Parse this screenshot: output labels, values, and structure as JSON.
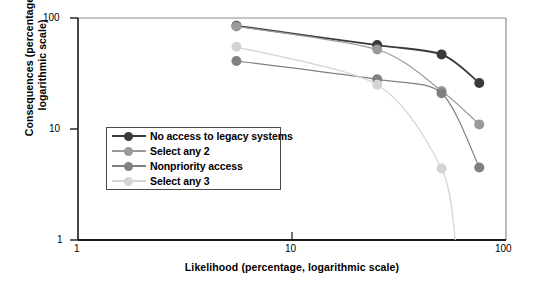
{
  "chart_data": {
    "type": "line",
    "title": "",
    "xlabel": "Likelihood (percentage, logarithmic scale)",
    "ylabel": "Consequences (percentage, logarithmic scale)",
    "xscale": "log",
    "yscale": "log",
    "xlim": [
      1,
      100
    ],
    "ylim": [
      1,
      100
    ],
    "xticks": [
      1,
      10,
      100
    ],
    "xticklabels": [
      "1",
      "10",
      "100"
    ],
    "yticks": [
      1,
      10,
      100
    ],
    "yticklabels": [
      "1",
      "10",
      "100"
    ],
    "grid": false,
    "legend_position": "center-left",
    "series": [
      {
        "name": "No access to legacy systems",
        "color": "#3a3a3a",
        "points": [
          {
            "x": 5.5,
            "y": 85
          },
          {
            "x": 25,
            "y": 57
          },
          {
            "x": 50,
            "y": 47
          },
          {
            "x": 75,
            "y": 26
          }
        ]
      },
      {
        "name": "Select any 2",
        "color": "#9a9a9a",
        "points": [
          {
            "x": 5.5,
            "y": 84
          },
          {
            "x": 25,
            "y": 52
          },
          {
            "x": 50,
            "y": 22
          },
          {
            "x": 75,
            "y": 11
          }
        ]
      },
      {
        "name": "Nonpriority access",
        "color": "#808080",
        "points": [
          {
            "x": 5.5,
            "y": 41
          },
          {
            "x": 25,
            "y": 28
          },
          {
            "x": 50,
            "y": 21
          },
          {
            "x": 75,
            "y": 4.5
          }
        ]
      },
      {
        "name": "Select any 3",
        "color": "#d4d4d4",
        "points": [
          {
            "x": 5.5,
            "y": 55
          },
          {
            "x": 25,
            "y": 25
          },
          {
            "x": 50,
            "y": 4.4
          },
          {
            "x": 58,
            "y": 1.0
          }
        ]
      }
    ]
  },
  "axes": {
    "x_title": "Likelihood (percentage, logarithmic scale)",
    "y_title": "Consequences (percentage, logarithmic scale)",
    "x_tick_1": "1",
    "x_tick_10": "10",
    "x_tick_100": "100",
    "y_tick_1": "1",
    "y_tick_10": "10",
    "y_tick_100": "100"
  },
  "legend": {
    "items": [
      {
        "label": "No access to legacy systems",
        "color": "#3a3a3a"
      },
      {
        "label": "Select any 2",
        "color": "#9a9a9a"
      },
      {
        "label": "Nonpriority access",
        "color": "#808080"
      },
      {
        "label": "Select any 3",
        "color": "#d4d4d4"
      }
    ]
  }
}
